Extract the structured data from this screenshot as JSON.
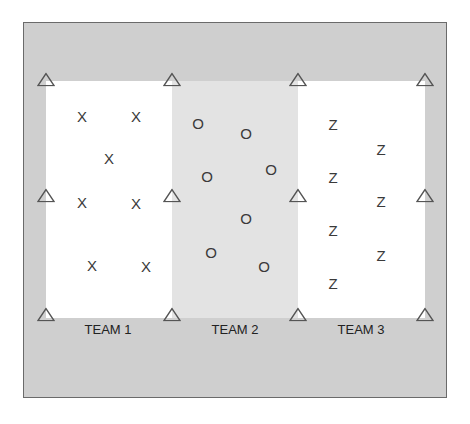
{
  "diagram": {
    "colors": {
      "outer_area": "#cfcfcf",
      "zone_light": "#ffffff",
      "zone_shaded": "#e3e3e3",
      "cone_stroke": "#555555",
      "symbol": "#3a3a3a"
    },
    "cone_icon": "triangle-outline",
    "teams": [
      {
        "label": "TEAM 1",
        "symbol": "X",
        "players": [
          [
            82,
            116
          ],
          [
            136,
            116
          ],
          [
            109,
            158
          ],
          [
            82,
            202
          ],
          [
            136,
            203
          ],
          [
            92,
            265
          ],
          [
            146,
            266
          ]
        ]
      },
      {
        "label": "TEAM 2",
        "symbol": "O",
        "players": [
          [
            198,
            123
          ],
          [
            246,
            133
          ],
          [
            207,
            176
          ],
          [
            271,
            169
          ],
          [
            246,
            218
          ],
          [
            211,
            252
          ],
          [
            264,
            266
          ]
        ]
      },
      {
        "label": "TEAM 3",
        "symbol": "Z",
        "players": [
          [
            333,
            124
          ],
          [
            381,
            149
          ],
          [
            333,
            177
          ],
          [
            381,
            201
          ],
          [
            333,
            230
          ],
          [
            381,
            255
          ],
          [
            333,
            283
          ]
        ]
      }
    ],
    "cones": [
      [
        46,
        81
      ],
      [
        172,
        81
      ],
      [
        298,
        81
      ],
      [
        425,
        81
      ],
      [
        46,
        197
      ],
      [
        172,
        197
      ],
      [
        298,
        197
      ],
      [
        425,
        197
      ],
      [
        46,
        316
      ],
      [
        172,
        316
      ],
      [
        298,
        316
      ],
      [
        425,
        316
      ]
    ],
    "label_positions": [
      108,
      235,
      361
    ]
  }
}
